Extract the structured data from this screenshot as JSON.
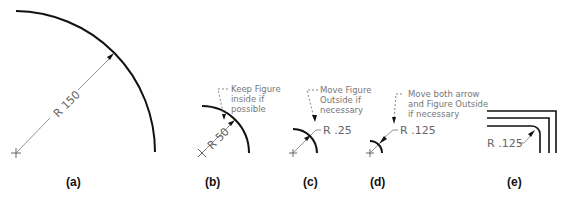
{
  "figures": [
    {
      "id": "a",
      "caption": "(a)",
      "dimension": "R 150",
      "note": []
    },
    {
      "id": "b",
      "caption": "(b)",
      "dimension": "R 50",
      "note": [
        "Keep Figure",
        "inside if",
        "possible"
      ]
    },
    {
      "id": "c",
      "caption": "(c)",
      "dimension": "R .25",
      "note": [
        "Move Figure",
        "Outside if",
        "necessary"
      ]
    },
    {
      "id": "d",
      "caption": "(d)",
      "dimension": "R .125",
      "note": [
        "Move both arrow",
        "and Figure Outside",
        "if necessary"
      ]
    },
    {
      "id": "e",
      "caption": "(e)",
      "dimension": "R .125",
      "note": []
    }
  ]
}
